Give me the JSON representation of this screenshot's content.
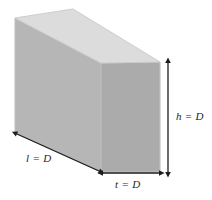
{
  "figure": {
    "type": "isometric-rectangular-prism-diagram",
    "background_color": "#ffffff",
    "shape": {
      "name": "rectangular-block",
      "faces": {
        "top": {
          "name": "top-face",
          "fill": "#dcdcdc"
        },
        "left": {
          "name": "left-side-face",
          "fill": "#b5b5b5"
        },
        "right": {
          "name": "right-end-face",
          "fill": "#ababab"
        }
      },
      "edge_color": "#c6c6c6"
    },
    "dimensions": [
      {
        "id": "length",
        "label": "l = D",
        "symbol": "l",
        "value": "D",
        "arrow": "double-headed",
        "orientation": "diagonal"
      },
      {
        "id": "thickness",
        "label": "t = D",
        "symbol": "t",
        "value": "D",
        "arrow": "double-headed",
        "orientation": "horizontal"
      },
      {
        "id": "height",
        "label": "h = D",
        "symbol": "h",
        "value": "D",
        "arrow": "double-headed",
        "orientation": "vertical"
      }
    ],
    "arrow_color": "#1d1d1d"
  }
}
